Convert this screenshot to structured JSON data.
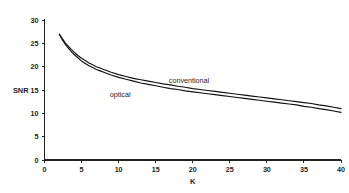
{
  "chart_data": {
    "type": "line",
    "title": "",
    "subtitle": "",
    "xlabel": "K",
    "ylabel": "SNR",
    "xlim": [
      0,
      40
    ],
    "ylim": [
      0,
      30
    ],
    "xticks": [
      0,
      5,
      10,
      15,
      20,
      25,
      30,
      35,
      40
    ],
    "yticks": [
      0,
      5,
      10,
      15,
      20,
      25,
      30
    ],
    "xtick_labels": [
      "0",
      "5",
      "10",
      "15",
      "20",
      "25",
      "30",
      "35",
      "40"
    ],
    "ytick_labels": [
      "0",
      "5",
      "10",
      "15",
      "20",
      "25",
      "30"
    ],
    "grid": false,
    "legend_position": "inline-annotation",
    "line_color": "#111111",
    "background_color": "#ffffff",
    "axis_color": "#222222",
    "annotations": [
      {
        "text": "conventional",
        "x": 19.5,
        "y": 16.6
      },
      {
        "text": "optical",
        "x": 10.2,
        "y": 13.6
      }
    ],
    "series": [
      {
        "name": "conventional",
        "x": [
          2.0,
          2.4,
          2.8,
          3.2,
          3.6,
          4.0,
          4.5,
          5.0,
          5.5,
          6.0,
          6.5,
          7.0,
          7.5,
          8.0,
          9.0,
          10.0,
          11.0,
          12.0,
          13.0,
          14.0,
          15.0,
          16.0,
          17.0,
          18.0,
          19.0,
          20.0,
          21.0,
          22.0,
          23.0,
          24.0,
          25.0,
          26.0,
          27.0,
          28.0,
          29.0,
          30.0,
          31.0,
          32.0,
          33.0,
          34.0,
          35.0,
          36.0,
          37.0,
          38.0,
          39.0,
          40.0
        ],
        "y": [
          27.0,
          26.0,
          25.1,
          24.4,
          23.7,
          23.1,
          22.4,
          21.8,
          21.3,
          20.8,
          20.4,
          20.0,
          19.7,
          19.4,
          18.8,
          18.3,
          17.9,
          17.5,
          17.2,
          16.9,
          16.6,
          16.3,
          16.1,
          15.8,
          15.6,
          15.3,
          15.1,
          14.9,
          14.7,
          14.5,
          14.3,
          14.1,
          13.9,
          13.7,
          13.5,
          13.3,
          13.1,
          12.9,
          12.7,
          12.5,
          12.3,
          12.1,
          11.8,
          11.6,
          11.3,
          11.0
        ]
      },
      {
        "name": "optical",
        "x": [
          2.0,
          2.4,
          2.8,
          3.2,
          3.6,
          4.0,
          4.5,
          5.0,
          5.5,
          6.0,
          6.5,
          7.0,
          7.5,
          8.0,
          9.0,
          10.0,
          11.0,
          12.0,
          13.0,
          14.0,
          15.0,
          16.0,
          17.0,
          18.0,
          19.0,
          20.0,
          21.0,
          22.0,
          23.0,
          24.0,
          25.0,
          26.0,
          27.0,
          28.0,
          29.0,
          30.0,
          31.0,
          32.0,
          33.0,
          34.0,
          35.0,
          36.0,
          37.0,
          38.0,
          39.0,
          40.0
        ],
        "y": [
          26.9,
          25.8,
          24.8,
          24.0,
          23.3,
          22.6,
          21.9,
          21.2,
          20.7,
          20.2,
          19.8,
          19.4,
          19.1,
          18.8,
          18.2,
          17.7,
          17.3,
          16.9,
          16.5,
          16.2,
          15.9,
          15.6,
          15.3,
          15.1,
          14.8,
          14.6,
          14.4,
          14.2,
          14.0,
          13.8,
          13.6,
          13.4,
          13.2,
          13.0,
          12.8,
          12.6,
          12.4,
          12.2,
          12.0,
          11.8,
          11.5,
          11.3,
          11.0,
          10.8,
          10.5,
          10.2
        ]
      }
    ]
  }
}
